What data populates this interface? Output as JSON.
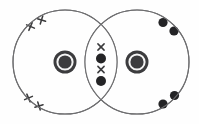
{
  "figure": {
    "width": 199,
    "height": 124,
    "background_color": "#fefefe"
  },
  "colors": {
    "shell_stroke": "#6e6e70",
    "nucleus_fill": "#3c3c3e",
    "nucleus_inner_fill": "#f2f2f2",
    "nucleus_label_color": "#f4f4f4",
    "cross_stroke": "#3a3a3c",
    "dot_fill": "#242426"
  },
  "atoms": [
    {
      "id": "left-oxygen-atom",
      "element_symbol": "O",
      "electron_marker": "cross",
      "shell": {
        "cx": 65,
        "cy": 62,
        "r": 52,
        "stroke_width": 1.1
      },
      "nucleus": {
        "cx": 65,
        "cy": 62,
        "outer_r": 11.5,
        "ring_r": 7.6,
        "inner_r": 5.2,
        "label": "O",
        "font_size": 12
      }
    },
    {
      "id": "right-oxygen-atom",
      "element_symbol": "O",
      "electron_marker": "dot",
      "shell": {
        "cx": 137,
        "cy": 62,
        "r": 52,
        "stroke_width": 1.1
      },
      "nucleus": {
        "cx": 137,
        "cy": 62,
        "outer_r": 11.5,
        "ring_r": 7.6,
        "inner_r": 5.2,
        "label": "O",
        "font_size": 12
      }
    }
  ],
  "lone_pair_electrons": {
    "left_atom_crosses": [
      {
        "name": "cross-top-outer",
        "x": 30.5,
        "y": 26.5,
        "size": 6.0,
        "rotation": -22
      },
      {
        "name": "cross-top-inner",
        "x": 41.5,
        "y": 20.0,
        "size": 6.0,
        "rotation": -28
      },
      {
        "name": "cross-bottom-outer",
        "x": 28.5,
        "y": 98.0,
        "size": 6.0,
        "rotation": 22
      },
      {
        "name": "cross-bottom-inner",
        "x": 39.0,
        "y": 106.0,
        "size": 6.0,
        "rotation": 28
      }
    ],
    "right_atom_dots": [
      {
        "name": "dot-top-inner",
        "x": 163.0,
        "y": 22.5,
        "r": 4.6
      },
      {
        "name": "dot-top-outer",
        "x": 174.0,
        "y": 31.0,
        "r": 4.6
      },
      {
        "name": "dot-bottom-outer",
        "x": 174.5,
        "y": 95.5,
        "r": 4.6
      },
      {
        "name": "dot-bottom-inner",
        "x": 163.0,
        "y": 104.0,
        "r": 4.6
      }
    ]
  },
  "bonding_electrons": {
    "label": "shared double bond pair",
    "count": 4,
    "overlap_center_x": 101,
    "items": [
      {
        "name": "bond-cross-upper",
        "type": "cross",
        "x": 101,
        "y": 47.0,
        "size": 6.2,
        "rotation": 0
      },
      {
        "name": "bond-dot-upper",
        "type": "dot",
        "x": 101,
        "y": 58.5,
        "r": 5.0
      },
      {
        "name": "bond-cross-lower",
        "type": "cross",
        "x": 101,
        "y": 69.5,
        "size": 6.2,
        "rotation": 0
      },
      {
        "name": "bond-dot-lower",
        "type": "dot",
        "x": 101,
        "y": 81.0,
        "r": 5.0
      }
    ]
  }
}
